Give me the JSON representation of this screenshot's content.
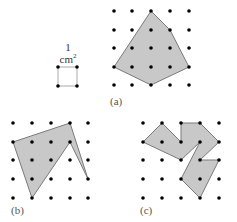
{
  "unit_square": {
    "label_line1": "1",
    "label_line2": "cm",
    "label_sup": "2"
  },
  "figures": [
    {
      "id": "a",
      "label": "(a)"
    },
    {
      "id": "b",
      "label": "(b)"
    },
    {
      "id": "c",
      "label": "(c)"
    }
  ],
  "colors": {
    "fill": "#c8c8c8",
    "stroke": "#7a7a7a",
    "dot": "#000000"
  }
}
